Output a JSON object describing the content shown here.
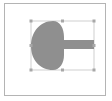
{
  "thumbnail": {
    "frame_color": "#b4b4b4",
    "background": "#ffffff"
  },
  "shape": {
    "name": "mushroom-shape",
    "fill": "#8f8f8f",
    "selected": true
  },
  "selection": {
    "stroke": "#bdbdbd",
    "handle_color": "#a8a8a8",
    "handles": [
      "top-left",
      "top-center",
      "top-right",
      "middle-left",
      "middle-right",
      "bottom-left",
      "bottom-center",
      "bottom-right"
    ]
  }
}
